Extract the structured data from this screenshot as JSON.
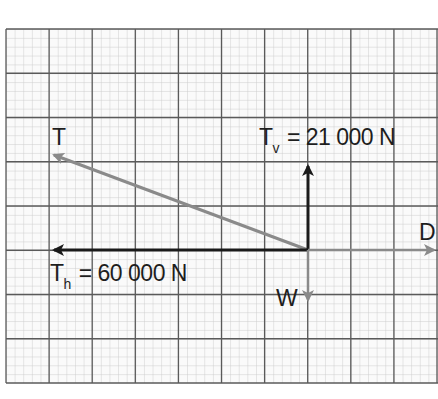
{
  "diagram": {
    "type": "vector force diagram on graph paper",
    "grid": {
      "major_cols": 10,
      "major_rows": 8,
      "minor_per_major": 5,
      "colors": {
        "major": "#5a5a5a",
        "minor": "#c9c9c9",
        "background": "#fafafa"
      }
    },
    "vectors": [
      {
        "id": "T",
        "label": "T",
        "color": "#8a8a8a",
        "direction": "up-left"
      },
      {
        "id": "Tv",
        "label": "T",
        "subscript": "v",
        "value_text": "= 21 000 N",
        "color": "#1a1a1a",
        "direction": "up"
      },
      {
        "id": "Th",
        "label": "T",
        "subscript": "h",
        "value_text": "= 60 000 N",
        "color": "#1a1a1a",
        "direction": "left"
      },
      {
        "id": "D",
        "label": "D",
        "color": "#8a8a8a",
        "direction": "right"
      },
      {
        "id": "W",
        "label": "W",
        "color": "#8a8a8a",
        "direction": "down"
      }
    ],
    "labels": {
      "T": "T",
      "Tv_main": "T",
      "Tv_sub": "v",
      "Tv_value": "= 21 000 N",
      "Th_main": "T",
      "Th_sub": "h",
      "Th_value": "= 60 000 N",
      "D": "D",
      "W": "W"
    }
  }
}
